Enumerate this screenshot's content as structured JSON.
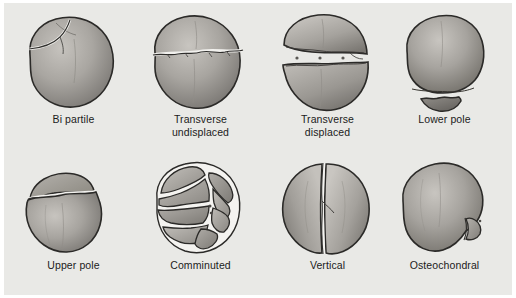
{
  "figure": {
    "background_color": "#e9e9e6",
    "page_color": "#ffffff",
    "bone_fill_light": "#b9b6b1",
    "bone_fill_dark": "#76736f",
    "outline_color": "#2b2a28",
    "fracture_gap_color": "#f4f3f0",
    "label_color": "#1b1b1b",
    "columns": 4,
    "rows": 2
  },
  "panels": [
    {
      "id": "bi-partile",
      "row": 0,
      "column": 0,
      "label_line1": "Bi partile",
      "label_line2": "",
      "pattern": "bipartite",
      "description": "Oblique fracture line isolating the superolateral corner fragment"
    },
    {
      "id": "transverse-undisplaced",
      "row": 0,
      "column": 1,
      "label_line1": "Transverse",
      "label_line2": "undisplaced",
      "pattern": "transverse-undisplaced",
      "description": "Horizontal mid-body fracture line with no separation of fragments"
    },
    {
      "id": "transverse-displaced",
      "row": 0,
      "column": 2,
      "label_line1": "Transverse",
      "label_line2": "displaced",
      "pattern": "transverse-displaced",
      "description": "Horizontal mid-body fracture with a wide gap separating upper and lower halves"
    },
    {
      "id": "lower-pole",
      "row": 0,
      "column": 3,
      "label_line1": "Lower pole",
      "label_line2": "",
      "pattern": "lower-pole",
      "description": "Small distal pole fragment separated from the main body"
    },
    {
      "id": "upper-pole",
      "row": 1,
      "column": 0,
      "label_line1": "Upper pole",
      "label_line2": "",
      "pattern": "upper-pole",
      "description": "Small proximal pole fragment separated from the main body"
    },
    {
      "id": "comminuted",
      "row": 1,
      "column": 1,
      "label_line1": "Comminuted",
      "label_line2": "",
      "pattern": "comminuted",
      "description": "Multifragmentary stellate pattern with eight separate bone fragments"
    },
    {
      "id": "vertical",
      "row": 1,
      "column": 2,
      "label_line1": "Vertical",
      "label_line2": "",
      "pattern": "vertical",
      "description": "Longitudinal fracture line running top to bottom through the body"
    },
    {
      "id": "osteochondral",
      "row": 1,
      "column": 3,
      "label_line1": "Osteochondral",
      "label_line2": "",
      "pattern": "osteochondral",
      "description": "Small osteochondral flake sheared from the inferolateral margin"
    }
  ]
}
